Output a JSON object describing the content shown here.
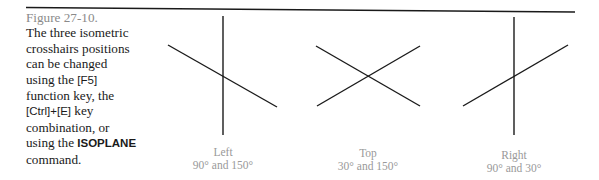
{
  "caption": {
    "figure_number": "Figure 27-10.",
    "text_part1": "The three isometric crosshairs positions can be changed using the ",
    "key1": "[F5]",
    "text_part2": " function key, the ",
    "key2": "[Ctrl]+[E]",
    "text_part3": " key combination, or using the ",
    "command": "ISOPLANE",
    "text_part4": " command."
  },
  "crosshairs": [
    {
      "name": "Left",
      "angles": "90° and 150°"
    },
    {
      "name": "Top",
      "angles": "30° and 150°"
    },
    {
      "name": "Right",
      "angles": "90° and 30°"
    }
  ],
  "colors": {
    "line": "#1a1a1a",
    "label": "#999999",
    "figure_number": "#8a8a8a"
  }
}
